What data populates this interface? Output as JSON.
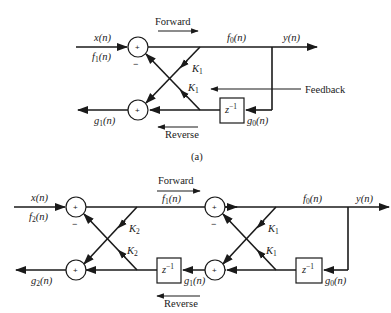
{
  "figure": {
    "panel_a": {
      "caption": "(a)",
      "stages": 1,
      "labels": {
        "input_x": "x(n)",
        "input_f": "f",
        "input_f_sub": "1",
        "output_f": "f",
        "output_f_sub": "0",
        "output_y": "y(n)",
        "output_g": "g",
        "output_g_sub": "1",
        "delay_g": "g",
        "delay_g_sub": "0",
        "k_upper": "K",
        "k_upper_sub": "1",
        "k_lower": "K",
        "k_lower_sub": "1",
        "delay": "z",
        "delay_exp": "−1",
        "arg": "(n)",
        "forward": "Forward",
        "reverse": "Reverse",
        "feedback": "Feedback",
        "plus": "+",
        "minus": "−"
      }
    },
    "panel_b": {
      "stages": 2,
      "labels": {
        "input_x": "x(n)",
        "input_f": "f",
        "input_f_sub": "2",
        "mid_f": "f",
        "mid_f_sub": "1",
        "output_f": "f",
        "output_f_sub": "0",
        "output_y": "y(n)",
        "output_g": "g",
        "output_g_sub": "2",
        "mid_g": "g",
        "mid_g_sub": "1",
        "delay_g": "g",
        "delay_g_sub": "0",
        "k2_upper": "K",
        "k2_upper_sub": "2",
        "k2_lower": "K",
        "k2_lower_sub": "2",
        "k1_upper": "K",
        "k1_upper_sub": "1",
        "k1_lower": "K",
        "k1_lower_sub": "1",
        "delay": "z",
        "delay_exp": "−1",
        "arg": "(n)",
        "forward": "Forward",
        "reverse": "Reverse",
        "plus": "+",
        "minus": "−"
      }
    }
  }
}
